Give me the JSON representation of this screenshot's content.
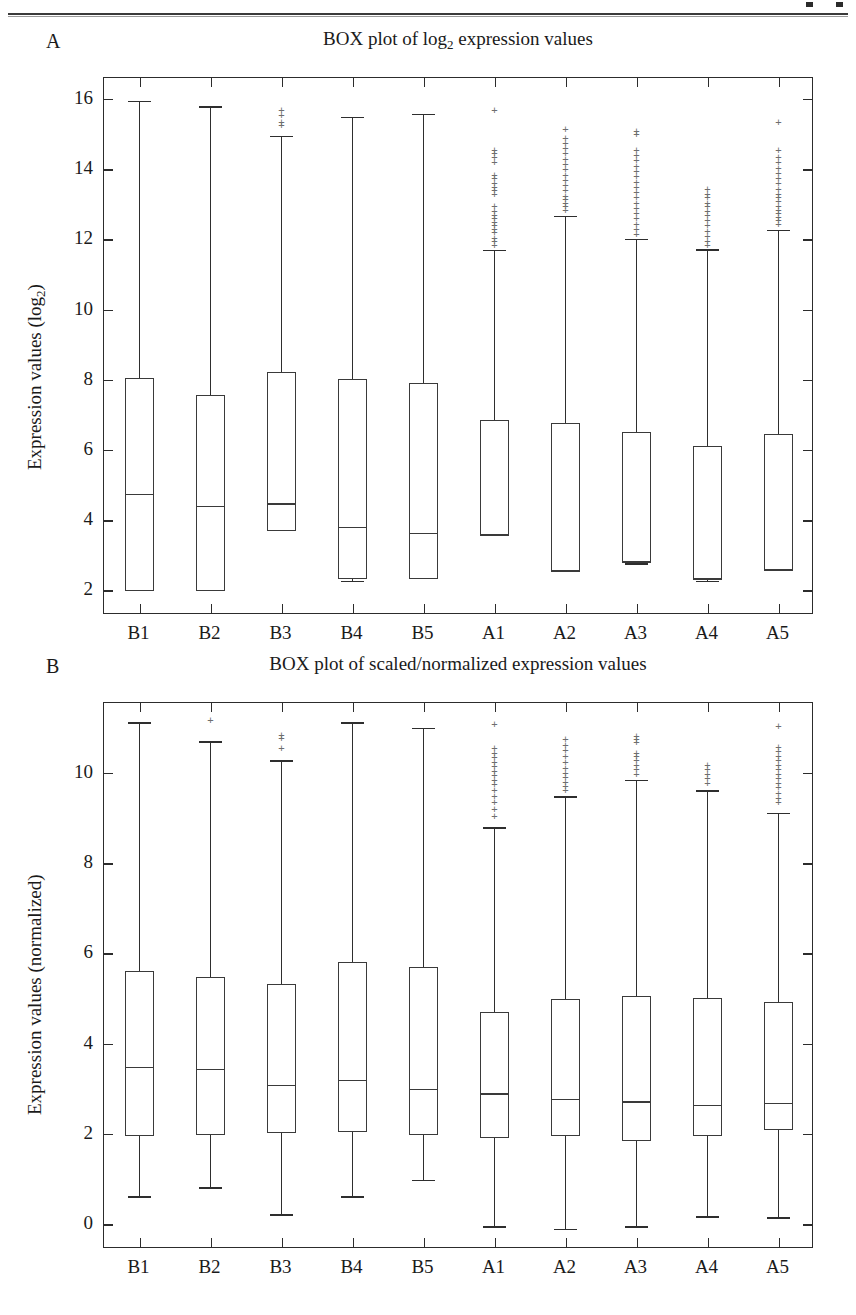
{
  "figure": {
    "panels": [
      {
        "letter": "A",
        "title_pre": "BOX plot of log",
        "title_sub": "2",
        "title_post": " expression values"
      },
      {
        "letter": "B",
        "title_pre": "BOX plot of scaled/normalized expression values",
        "title_sub": "",
        "title_post": ""
      }
    ]
  },
  "chart_data": [
    {
      "type": "box",
      "panel": "A",
      "title": "BOX plot of log2 expression values",
      "xlabel": "",
      "ylabel": "Expression values (log2)",
      "ylim": [
        1.3,
        16.6
      ],
      "yticks": [
        2,
        4,
        6,
        8,
        10,
        12,
        14,
        16
      ],
      "grid": false,
      "legend": "none",
      "categories": [
        "B1",
        "B2",
        "B3",
        "B4",
        "B5",
        "A1",
        "A2",
        "A3",
        "A4",
        "A5"
      ],
      "boxes": [
        {
          "label": "B1",
          "whisker_low": 1.95,
          "q1": 1.98,
          "median": 4.75,
          "q3": 8.05,
          "whisker_high": 15.95,
          "outliers": []
        },
        {
          "label": "B2",
          "whisker_low": 1.95,
          "q1": 1.98,
          "median": 4.4,
          "q3": 7.58,
          "whisker_high": 15.8,
          "outliers": []
        },
        {
          "label": "B3",
          "whisker_low": 3.68,
          "q1": 3.7,
          "median": 4.48,
          "q3": 8.22,
          "whisker_high": 14.95,
          "outliers": [
            15.35,
            15.55,
            15.7,
            15.25
          ]
        },
        {
          "label": "B4",
          "whisker_low": 2.28,
          "q1": 2.32,
          "median": 3.82,
          "q3": 8.02,
          "whisker_high": 15.5,
          "outliers": []
        },
        {
          "label": "B5",
          "whisker_low": 2.3,
          "q1": 2.33,
          "median": 3.65,
          "q3": 7.92,
          "whisker_high": 15.58,
          "outliers": []
        },
        {
          "label": "A1",
          "whisker_low": 3.55,
          "q1": 3.58,
          "median": 3.58,
          "q3": 6.85,
          "whisker_high": 11.7,
          "outliers": [
            15.7,
            14.55,
            14.45,
            14.35,
            14.2,
            13.85,
            13.75,
            13.6,
            13.5,
            13.4,
            13.3,
            12.95,
            12.8,
            12.7,
            12.6,
            12.5,
            12.4,
            12.3,
            12.2,
            12.05,
            11.95,
            11.85
          ]
        },
        {
          "label": "A2",
          "whisker_low": 2.52,
          "q1": 2.55,
          "median": 2.55,
          "q3": 6.78,
          "whisker_high": 12.68,
          "outliers": [
            15.15,
            14.9,
            14.75,
            14.6,
            14.45,
            14.3,
            14.15,
            14.0,
            13.85,
            13.7,
            13.55,
            13.4,
            13.25,
            13.15,
            13.05,
            12.95,
            12.85
          ]
        },
        {
          "label": "A3",
          "whisker_low": 2.78,
          "q1": 2.82,
          "median": 2.82,
          "q3": 6.52,
          "whisker_high": 12.02,
          "outliers": [
            15.1,
            15.0,
            14.55,
            14.4,
            14.25,
            14.1,
            13.95,
            13.8,
            13.65,
            13.5,
            13.35,
            13.2,
            13.05,
            12.9,
            12.75,
            12.6,
            12.45,
            12.3,
            12.15
          ]
        },
        {
          "label": "A4",
          "whisker_low": 2.28,
          "q1": 2.32,
          "median": 2.32,
          "q3": 6.12,
          "whisker_high": 11.72,
          "outliers": [
            13.45,
            13.3,
            13.2,
            13.05,
            12.95,
            12.8,
            12.7,
            12.55,
            12.4,
            12.25,
            12.1,
            11.95,
            11.85
          ]
        },
        {
          "label": "A5",
          "whisker_low": 2.55,
          "q1": 2.58,
          "median": 2.58,
          "q3": 6.45,
          "whisker_high": 12.28,
          "outliers": [
            15.35,
            14.55,
            14.35,
            14.2,
            14.05,
            13.9,
            13.75,
            13.6,
            13.45,
            13.3,
            13.2,
            13.1,
            12.95,
            12.85,
            12.75,
            12.65,
            12.55,
            12.45
          ]
        }
      ]
    },
    {
      "type": "box",
      "panel": "B",
      "title": "BOX plot of scaled/normalized expression values",
      "xlabel": "",
      "ylabel": "Expression values (normalized)",
      "ylim": [
        -0.55,
        11.55
      ],
      "yticks": [
        0,
        2,
        4,
        6,
        8,
        10
      ],
      "grid": false,
      "legend": "none",
      "categories": [
        "B1",
        "B2",
        "B3",
        "B4",
        "B5",
        "A1",
        "A2",
        "A3",
        "A4",
        "A5"
      ],
      "boxes": [
        {
          "label": "B1",
          "whisker_low": 0.62,
          "q1": 1.95,
          "median": 3.48,
          "q3": 5.6,
          "whisker_high": 11.12,
          "outliers": []
        },
        {
          "label": "B2",
          "whisker_low": 0.82,
          "q1": 1.98,
          "median": 3.45,
          "q3": 5.48,
          "whisker_high": 10.7,
          "outliers": [
            11.18
          ]
        },
        {
          "label": "B3",
          "whisker_low": 0.22,
          "q1": 2.02,
          "median": 3.08,
          "q3": 5.32,
          "whisker_high": 10.28,
          "outliers": [
            10.85,
            10.78,
            10.55
          ]
        },
        {
          "label": "B4",
          "whisker_low": 0.62,
          "q1": 2.05,
          "median": 3.2,
          "q3": 5.8,
          "whisker_high": 11.12,
          "outliers": []
        },
        {
          "label": "B5",
          "whisker_low": 0.98,
          "q1": 1.98,
          "median": 3.0,
          "q3": 5.7,
          "whisker_high": 11.0,
          "outliers": []
        },
        {
          "label": "A1",
          "whisker_low": -0.05,
          "q1": 1.92,
          "median": 2.9,
          "q3": 4.7,
          "whisker_high": 8.8,
          "outliers": [
            11.08,
            10.55,
            10.45,
            10.35,
            10.25,
            10.15,
            10.05,
            9.95,
            9.85,
            9.75,
            9.62,
            9.5,
            9.35,
            9.2,
            9.05
          ]
        },
        {
          "label": "A2",
          "whisker_low": -0.1,
          "q1": 1.95,
          "median": 2.78,
          "q3": 4.98,
          "whisker_high": 9.48,
          "outliers": [
            10.75,
            10.62,
            10.5,
            10.38,
            10.25,
            10.12,
            10.0,
            9.9,
            9.8,
            9.7,
            9.62
          ]
        },
        {
          "label": "A3",
          "whisker_low": -0.05,
          "q1": 1.85,
          "median": 2.72,
          "q3": 5.05,
          "whisker_high": 9.85,
          "outliers": [
            10.82,
            10.75,
            10.68,
            10.45,
            10.38,
            10.28,
            10.18,
            10.08,
            9.98
          ]
        },
        {
          "label": "A4",
          "whisker_low": 0.18,
          "q1": 1.95,
          "median": 2.65,
          "q3": 5.02,
          "whisker_high": 9.62,
          "outliers": [
            10.18,
            10.08,
            9.98,
            9.88,
            9.78
          ]
        },
        {
          "label": "A5",
          "whisker_low": 0.15,
          "q1": 2.08,
          "median": 2.68,
          "q3": 4.92,
          "whisker_high": 9.12,
          "outliers": [
            11.05,
            10.58,
            10.48,
            10.38,
            10.28,
            10.18,
            10.08,
            9.98,
            9.88,
            9.78,
            9.68,
            9.55,
            9.45,
            9.35
          ]
        }
      ]
    }
  ]
}
